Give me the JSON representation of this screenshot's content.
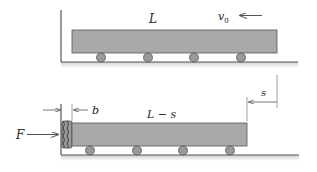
{
  "diagram": {
    "type": "physics-mechanics",
    "colors": {
      "block_fill": "#a9a9a9",
      "block_stroke": "#555555",
      "wheel_fill": "#999999",
      "line": "#444444",
      "floor_shadow": "#d6d6d6"
    },
    "top_panel": {
      "length_label": "L",
      "velocity_label": "v",
      "velocity_subscript": "0",
      "wheel_count": 4
    },
    "bottom_panel": {
      "length_label": "L − s",
      "force_label": "F",
      "bumper_label": "b",
      "displacement_label": "s",
      "wheel_count": 4
    }
  }
}
